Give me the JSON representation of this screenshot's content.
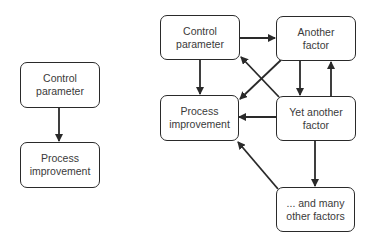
{
  "diagram": {
    "left": {
      "nodes": [
        {
          "id": "control",
          "label": "Control\nparameter"
        },
        {
          "id": "process",
          "label": "Process\nimprovement"
        }
      ],
      "edges": [
        {
          "from": "control",
          "to": "process"
        }
      ]
    },
    "right": {
      "nodes": [
        {
          "id": "control",
          "label": "Control\nparameter"
        },
        {
          "id": "another",
          "label": "Another\nfactor"
        },
        {
          "id": "process",
          "label": "Process\nimprovement"
        },
        {
          "id": "yet_another",
          "label": "Yet another\nfactor"
        },
        {
          "id": "many",
          "label": "... and many\nother factors"
        }
      ],
      "edges": [
        {
          "from": "control",
          "to": "another"
        },
        {
          "from": "control",
          "to": "process"
        },
        {
          "from": "another",
          "to": "process"
        },
        {
          "from": "another",
          "to": "yet_another"
        },
        {
          "from": "yet_another",
          "to": "another"
        },
        {
          "from": "yet_another",
          "to": "control"
        },
        {
          "from": "yet_another",
          "to": "process"
        },
        {
          "from": "yet_another",
          "to": "many"
        },
        {
          "from": "many",
          "to": "process"
        }
      ]
    },
    "colors": {
      "stroke": "#2a2a2a",
      "text": "#3a3a3a",
      "background": "#ffffff"
    }
  }
}
